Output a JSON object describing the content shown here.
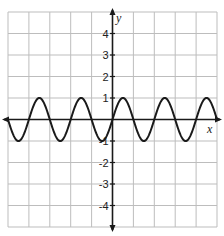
{
  "chart_data": {
    "type": "line",
    "title": "",
    "xlabel": "x",
    "ylabel": "y",
    "xlim": [
      -5,
      5
    ],
    "ylim": [
      -5,
      5
    ],
    "grid": true,
    "x_ticks": [],
    "y_ticks": [
      -4,
      -3,
      -2,
      -1,
      1,
      2,
      3,
      4
    ],
    "y_tick_labels": [
      "-4",
      "-3",
      "-2",
      "-1",
      "1",
      "2",
      "3",
      "4"
    ],
    "series": [
      {
        "name": "y = sin(πx)",
        "function": "sin(pi*x)",
        "amplitude": 1,
        "period": 2,
        "x": [
          -5,
          -4.5,
          -4,
          -3.5,
          -3,
          -2.5,
          -2,
          -1.5,
          -1,
          -0.5,
          0,
          0.5,
          1,
          1.5,
          2,
          2.5,
          3,
          3.5,
          4,
          4.5,
          5
        ],
        "values": [
          0,
          1,
          0,
          1,
          0,
          -1,
          0,
          1,
          0,
          -1,
          0,
          1,
          0,
          -1,
          0,
          1,
          0,
          -1,
          0,
          1,
          0
        ]
      }
    ],
    "legend": null
  },
  "labels": {
    "x_axis": "x",
    "y_axis": "y"
  }
}
